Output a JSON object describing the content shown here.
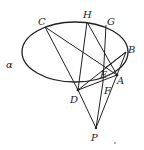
{
  "diagram": {
    "type": "geometry-figure",
    "plane_label": "α",
    "ellipse": {
      "cx": 75,
      "cy": 52,
      "rx": 53,
      "ry": 30
    },
    "points": {
      "C": {
        "label": "C",
        "x": 45,
        "y": 27
      },
      "H": {
        "label": "H",
        "x": 87,
        "y": 22
      },
      "G": {
        "label": "G",
        "x": 106,
        "y": 25
      },
      "B": {
        "label": "B",
        "x": 126,
        "y": 52
      },
      "E": {
        "label": "E",
        "x": 105,
        "y": 68
      },
      "A": {
        "label": "A",
        "x": 117,
        "y": 75
      },
      "F": {
        "label": "F",
        "x": 103,
        "y": 82
      },
      "D": {
        "label": "D",
        "x": 78,
        "y": 90
      },
      "P": {
        "label": "P",
        "x": 96,
        "y": 128
      }
    },
    "segments": [
      [
        "C",
        "D"
      ],
      [
        "C",
        "A"
      ],
      [
        "H",
        "D"
      ],
      [
        "H",
        "A"
      ],
      [
        "G",
        "F"
      ],
      [
        "B",
        "D"
      ],
      [
        "B",
        "A"
      ],
      [
        "B",
        "E"
      ],
      [
        "D",
        "P"
      ],
      [
        "P",
        "A"
      ],
      [
        "P",
        "F"
      ],
      [
        "D",
        "A"
      ]
    ],
    "labels": {
      "alpha": "α",
      "C": "C",
      "H": "H",
      "G": "G",
      "B": "B",
      "E": "E",
      "A": "A",
      "F": "F",
      "D": "D",
      "P": "P"
    }
  }
}
